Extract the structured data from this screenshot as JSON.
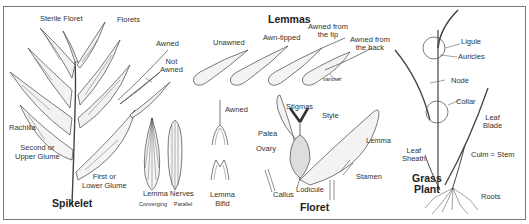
{
  "diagram": {
    "clipped_header": "Anatomy of Grass",
    "colors": {
      "line": "#444444",
      "fill_light": "#e6e6e6",
      "border": "#777777",
      "background": "#ffffff"
    },
    "sections": {
      "spikelet": {
        "title": "Spikelet",
        "labels": {
          "sterile_floret": "Sterile Floret",
          "florets": "Florets",
          "rachilla": "Rachilla",
          "second_glume": "Second or\nUpper Glume",
          "first_glume": "First or\nLower Glume"
        }
      },
      "awn_examples": {
        "awned": "Awned",
        "not_awned": "Not\nAwned"
      },
      "lemmas": {
        "title": "Lemmas",
        "types": [
          "Unawned",
          "Awn-tipped",
          "Awned from\nthe tip",
          "Awned from\nthe back"
        ],
        "note": "various"
      },
      "lemma_nerves": {
        "caption": "Lemma Nerves",
        "variants": [
          "Converging",
          "Parallel"
        ]
      },
      "lemma_tips": {
        "awned": "Awned",
        "bifid": "Lemma\nBifid"
      },
      "floret": {
        "title": "Floret",
        "labels": {
          "stigmas": "Stigmas",
          "style": "Style",
          "palea": "Palea",
          "ovary": "Ovary",
          "lemma": "Lemma",
          "lodicule": "Lodicule",
          "callus": "Callus",
          "stamen": "Stamen"
        }
      },
      "grass_plant": {
        "title": "Grass\nPlant",
        "labels": {
          "ligule": "Ligule",
          "auricles": "Auricles",
          "node": "Node",
          "collar": "Collar",
          "leaf_blade": "Leaf\nBlade",
          "leaf_sheath": "Leaf\nSheath",
          "culm": "Culm = Stem",
          "roots": "Roots"
        }
      }
    }
  }
}
